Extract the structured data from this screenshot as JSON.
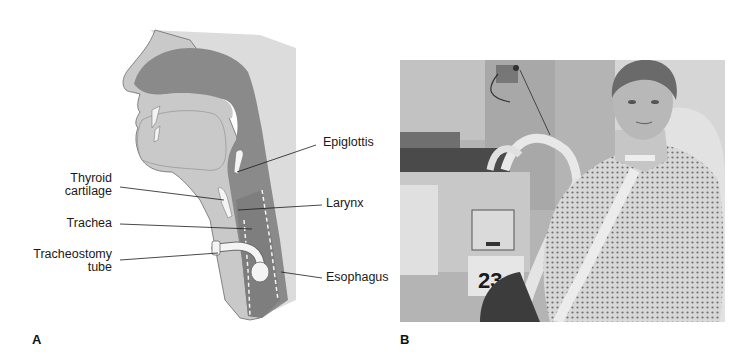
{
  "figure": {
    "panels": [
      {
        "letter": "A",
        "type": "anatomical-illustration",
        "labels": {
          "epiglottis": "Epiglottis",
          "thyroid_cartilage_line1": "Thyroid",
          "thyroid_cartilage_line2": "cartilage",
          "larynx": "Larynx",
          "trachea": "Trachea",
          "tracheostomy_tube_line1": "Tracheostomy",
          "tracheostomy_tube_line2": "tube",
          "esophagus": "Esophagus"
        }
      },
      {
        "letter": "B",
        "type": "photograph",
        "visible_text": {
          "equipment_number": "23"
        }
      }
    ]
  },
  "colors": {
    "background": "#ffffff",
    "skin_light": "#c9c9c9",
    "back_tissue": "#dcdcdc",
    "airway_dark": "#8a8a8a",
    "cartilage_white": "#f4f4f4",
    "text": "#1a1a1a"
  }
}
